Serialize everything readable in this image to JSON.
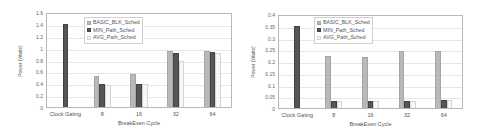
{
  "series_styles": {
    "BASIC_BLK_Sched": {
      "fill": "#b9b9b9",
      "border": "#a6a6a6"
    },
    "MIN_Path_Sched": {
      "fill": "#555555",
      "border": "#444444"
    },
    "AVG_Path_Sched": {
      "fill": "#f7f7f7",
      "border": "#d4d4d4"
    }
  },
  "chart_data": [
    {
      "type": "bar",
      "title": "",
      "xlabel": "BreakEven Cycle",
      "ylabel": "Power (Watts)",
      "categories": [
        "Clock Gating",
        "8",
        "16",
        "32",
        "64"
      ],
      "ylim": [
        0,
        1.6
      ],
      "yticks": [
        "0",
        "0.2",
        "0.4",
        "0.6",
        "0.8",
        "1",
        "1.2",
        "1.4",
        "1.6"
      ],
      "grid": true,
      "legend_position": "upper-left-inside",
      "series": [
        {
          "name": "BASIC_BLK_Sched",
          "values": [
            null,
            0.53,
            0.57,
            0.97,
            0.97
          ]
        },
        {
          "name": "MIN_Path_Sched",
          "values": [
            1.42,
            0.4,
            0.4,
            0.93,
            0.94
          ]
        },
        {
          "name": "AVG_Path_Sched",
          "values": [
            null,
            0.38,
            0.39,
            0.8,
            0.93
          ]
        }
      ]
    },
    {
      "type": "bar",
      "title": "",
      "xlabel": "BreakEven Cycle",
      "ylabel": "Power (Watts)",
      "categories": [
        "Clock Gating",
        "8",
        "16",
        "32",
        "64"
      ],
      "ylim": [
        0,
        0.4
      ],
      "yticks": [
        "0",
        "0.05",
        "0.1",
        "0.15",
        "0.2",
        "0.25",
        "0.3",
        "0.35",
        "0.4"
      ],
      "grid": true,
      "legend_position": "upper-left-inside",
      "series": [
        {
          "name": "BASIC_BLK_Sched",
          "values": [
            null,
            0.225,
            0.22,
            0.25,
            0.25
          ]
        },
        {
          "name": "MIN_Path_Sched",
          "values": [
            0.355,
            0.032,
            0.03,
            0.032,
            0.035
          ]
        },
        {
          "name": "AVG_Path_Sched",
          "values": [
            null,
            0.03,
            0.03,
            0.032,
            0.035
          ]
        }
      ]
    }
  ]
}
